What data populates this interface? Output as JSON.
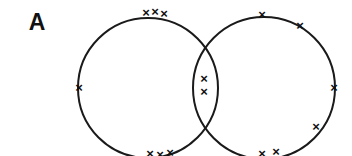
{
  "figure": {
    "panel_label": "A",
    "width": 352,
    "height": 156,
    "background_color": "#ffffff",
    "stroke_color": "#1a1a1a",
    "mark_color": "#111111",
    "stroke_width": 2,
    "mark_glyph": "×"
  },
  "panel_label_position": {
    "x": 37,
    "y": 30
  },
  "chart_data": {
    "type": "venn",
    "title": "A",
    "xlabel": "",
    "ylabel": "",
    "grid": false,
    "legend": "none",
    "sets": [
      {
        "name": "left-set",
        "center_x": 148,
        "center_y": 88,
        "radius": 70,
        "exclusive_marks": 7
      },
      {
        "name": "right-set",
        "center_x": 264,
        "center_y": 88,
        "radius": 71,
        "exclusive_marks": 6
      }
    ],
    "intersection": {
      "name": "overlap",
      "marks": 2
    },
    "marks": [
      {
        "id": "m01",
        "x": 146,
        "y": 14,
        "region": "left-set"
      },
      {
        "id": "m02",
        "x": 155,
        "y": 13,
        "region": "left-set"
      },
      {
        "id": "m03",
        "x": 164,
        "y": 15,
        "region": "left-set"
      },
      {
        "id": "m04",
        "x": 79,
        "y": 89,
        "region": "left-set"
      },
      {
        "id": "m05",
        "x": 150,
        "y": 155,
        "region": "left-set"
      },
      {
        "id": "m06",
        "x": 160,
        "y": 156,
        "region": "left-set"
      },
      {
        "id": "m07",
        "x": 170,
        "y": 154,
        "region": "left-set"
      },
      {
        "id": "m08",
        "x": 204,
        "y": 80,
        "region": "overlap"
      },
      {
        "id": "m09",
        "x": 204,
        "y": 93,
        "region": "overlap"
      },
      {
        "id": "m10",
        "x": 262,
        "y": 16,
        "region": "right-set"
      },
      {
        "id": "m11",
        "x": 300,
        "y": 27,
        "region": "right-set"
      },
      {
        "id": "m12",
        "x": 334,
        "y": 89,
        "region": "right-set"
      },
      {
        "id": "m13",
        "x": 316,
        "y": 128,
        "region": "right-set"
      },
      {
        "id": "m14",
        "x": 262,
        "y": 155,
        "region": "right-set"
      },
      {
        "id": "m15",
        "x": 276,
        "y": 153,
        "region": "right-set"
      }
    ]
  }
}
